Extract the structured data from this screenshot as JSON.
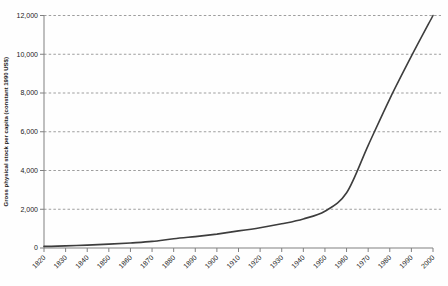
{
  "page": {
    "background": "#fefefe"
  },
  "chart_data": {
    "type": "line",
    "title": "",
    "xlabel": "",
    "ylabel": "Gross physical stock per capita (constant 1990 US$)",
    "x": [
      1820,
      1830,
      1840,
      1850,
      1860,
      1870,
      1880,
      1890,
      1900,
      1910,
      1920,
      1930,
      1940,
      1950,
      1960,
      1970,
      1980,
      1990,
      2000
    ],
    "x_tick_labels": [
      "1820",
      "1830",
      "1840",
      "1850",
      "1860",
      "1870",
      "1880",
      "1890",
      "1900",
      "1910",
      "1920",
      "1930",
      "1940",
      "1950",
      "1960",
      "1970",
      "1980",
      "1990",
      "2000"
    ],
    "series": [
      {
        "name": "Gross physical stock per capita",
        "values": [
          80,
          110,
          150,
          200,
          260,
          340,
          480,
          590,
          720,
          880,
          1050,
          1250,
          1500,
          1900,
          2850,
          5300,
          7700,
          9900,
          12000
        ]
      }
    ],
    "xlim": [
      1820,
      2000
    ],
    "ylim": [
      0,
      12000
    ],
    "y_ticks": [
      0,
      2000,
      4000,
      6000,
      8000,
      10000,
      12000
    ],
    "y_tick_labels": [
      "0",
      "2,000",
      "4,000",
      "6,000",
      "8,000",
      "10,000",
      "12,000"
    ],
    "grid": "horizontal-dashed",
    "legend": "none",
    "colors": {
      "line": "#3d3d3d",
      "axis": "#808080",
      "gridline": "#9e9e9e",
      "text": "#1a1a1a",
      "background": "#fefefe"
    }
  }
}
